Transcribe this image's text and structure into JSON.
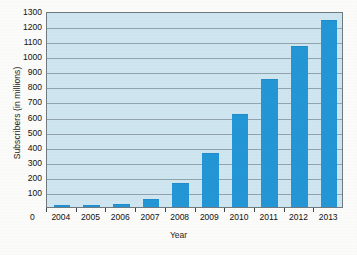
{
  "chart_data": {
    "type": "bar",
    "title": "",
    "xlabel": "Year",
    "ylabel": "Subscribers (in millions)",
    "categories": [
      "2004",
      "2005",
      "2006",
      "2007",
      "2008",
      "2009",
      "2010",
      "2011",
      "2012",
      "2013"
    ],
    "values": [
      3,
      6,
      11,
      45,
      150,
      350,
      610,
      845,
      1060,
      1235
    ],
    "ylim": [
      0,
      1300
    ],
    "ytick_labels": [
      "1300",
      "1200",
      "1100",
      "1000",
      "900",
      "800",
      "700",
      "600",
      "500",
      "400",
      "300",
      "200",
      "100"
    ],
    "ytick_values": [
      1300,
      1200,
      1100,
      1000,
      900,
      800,
      700,
      600,
      500,
      400,
      300,
      200,
      100
    ],
    "origin_label": "0",
    "grid": true,
    "legend": "none",
    "series": [
      {
        "name": "Subscribers",
        "values": [
          3,
          6,
          11,
          45,
          150,
          350,
          610,
          845,
          1060,
          1235
        ]
      }
    ],
    "colors": {
      "bar": "#2396d6",
      "plot_background": "#cfe5ef",
      "gridline": "#7d8d95",
      "axis": "#6e7a80",
      "page_background": "#fbfbf9",
      "text": "#111111"
    }
  }
}
